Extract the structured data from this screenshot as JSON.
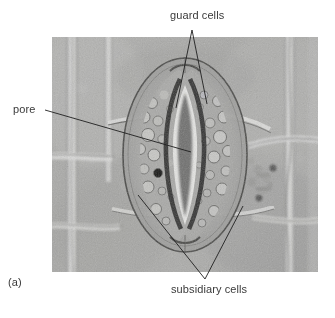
{
  "figure": {
    "panel_label": "(a)",
    "caption_absent": true
  },
  "labels": {
    "guard_cells": "guard cells",
    "pore": "pore",
    "subsidiary_cells": "subsidiary cells"
  },
  "micrograph": {
    "name": "light-micrograph-stoma-surface-view",
    "frame": {
      "x": 52,
      "y": 37,
      "width": 266,
      "height": 235
    },
    "background_gray": "#a9a9a9",
    "wall_light": "#d8d8d6",
    "wall_dark": "#4a4a48",
    "pore_dark": "#1a1a1a"
  },
  "leaders": {
    "guard_cells": {
      "apex": {
        "x": 192,
        "y": 30
      },
      "tips": [
        {
          "x": 176,
          "y": 108
        },
        {
          "x": 207,
          "y": 104
        }
      ]
    },
    "pore": {
      "start": {
        "x": 45,
        "y": 110
      },
      "end": {
        "x": 191,
        "y": 152
      }
    },
    "subsidiary_cells": {
      "apex": {
        "x": 205,
        "y": 279
      },
      "tips": [
        {
          "x": 138,
          "y": 195
        },
        {
          "x": 243,
          "y": 206
        }
      ]
    }
  },
  "colors": {
    "text": "#3a3a3a",
    "leader_line": "#1f1f1f",
    "page_background": "#ffffff"
  }
}
